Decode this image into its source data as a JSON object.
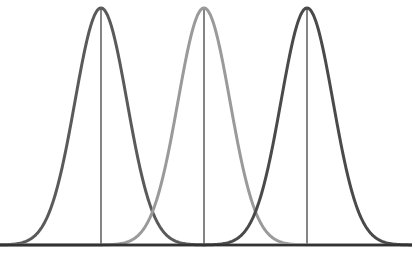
{
  "chart_data": {
    "type": "line",
    "title": "",
    "xlabel": "",
    "ylabel": "",
    "grid": false,
    "legend": null,
    "series": [
      {
        "name": "distribution-1",
        "mean": 101,
        "sd": 26,
        "color": "#5a5a5a",
        "mean_line": true
      },
      {
        "name": "distribution-2",
        "mean": 204,
        "sd": 26,
        "color": "#9a9a9a",
        "mean_line": true
      },
      {
        "name": "distribution-3",
        "mean": 307,
        "sd": 26,
        "color": "#4a4a4a",
        "mean_line": true
      }
    ],
    "axis": {
      "baseline_y": 245,
      "peak_y": 8,
      "x_start": 0,
      "x_end": 412
    },
    "colors": {
      "axis": "#333333",
      "mean_line": "#333333"
    }
  }
}
